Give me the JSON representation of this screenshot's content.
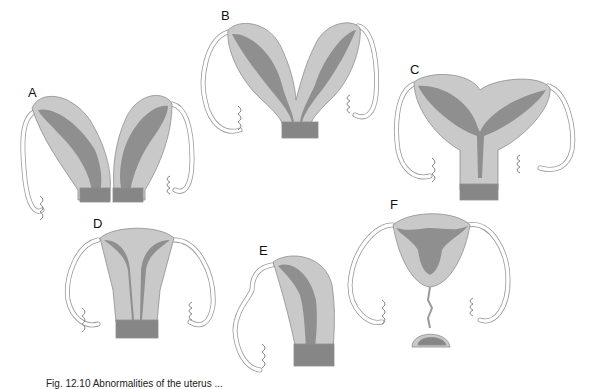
{
  "figure": {
    "panels": [
      {
        "id": "A",
        "label": "A",
        "description": "uterus didelphys"
      },
      {
        "id": "B",
        "label": "B",
        "description": "bicornuate uterus, separate horns"
      },
      {
        "id": "C",
        "label": "C",
        "description": "bicornuate uterus with single cervix"
      },
      {
        "id": "D",
        "label": "D",
        "description": "septate uterus"
      },
      {
        "id": "E",
        "label": "E",
        "description": "unicornuate uterus"
      },
      {
        "id": "F",
        "label": "F",
        "description": "uterus with cervical atresia"
      }
    ],
    "caption": "Fig. 12.10  Abnormalities of the uterus ..."
  },
  "colors": {
    "outer": "#c9c9c9",
    "inner": "#8f8f8f",
    "outline": "#8e8e8e"
  }
}
